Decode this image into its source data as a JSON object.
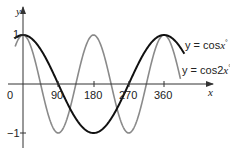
{
  "chart_data": {
    "type": "line",
    "title": "",
    "xlabel": "x",
    "ylabel": "y",
    "xlim": [
      -20,
      410
    ],
    "ylim": [
      -1.2,
      1.5
    ],
    "grid": false,
    "x_ticks": [
      0,
      90,
      180,
      270,
      360
    ],
    "x_tick_labels": [
      "0",
      "90",
      "180",
      "270",
      "360"
    ],
    "y_ticks": [
      1,
      -1
    ],
    "y_tick_labels": [
      "1",
      "−1"
    ],
    "series": [
      {
        "name": "y = cosx°",
        "function": "cos(x°)",
        "color": "#111111",
        "x": [
          0,
          90,
          180,
          270,
          360
        ],
        "values": [
          1,
          0,
          -1,
          0,
          1
        ]
      },
      {
        "name": "y = cos2x°",
        "function": "cos(2x°)",
        "color": "#8a8a8a",
        "x": [
          0,
          45,
          90,
          135,
          180,
          225,
          270,
          315,
          360
        ],
        "values": [
          1,
          0,
          -1,
          0,
          1,
          0,
          -1,
          0,
          1
        ]
      }
    ],
    "legend": {
      "position": "right, inline labels",
      "entries": [
        "y = cosx°",
        "y = cos2x°"
      ]
    }
  },
  "labels": {
    "x_axis": "x",
    "y_axis": "y",
    "origin": "0",
    "x90": "90",
    "x180": "180",
    "x270": "270",
    "x360": "360",
    "y_pos1": "1",
    "y_neg1": "−1",
    "legend_cos_prefix": "y = cos",
    "legend_cos_var": "x",
    "legend_cos2_prefix": "y = cos2",
    "legend_cos2_var": "x",
    "degree": "°"
  },
  "colors": {
    "cos": "#111111",
    "cos2": "#8a8a8a",
    "axis": "#333333"
  }
}
